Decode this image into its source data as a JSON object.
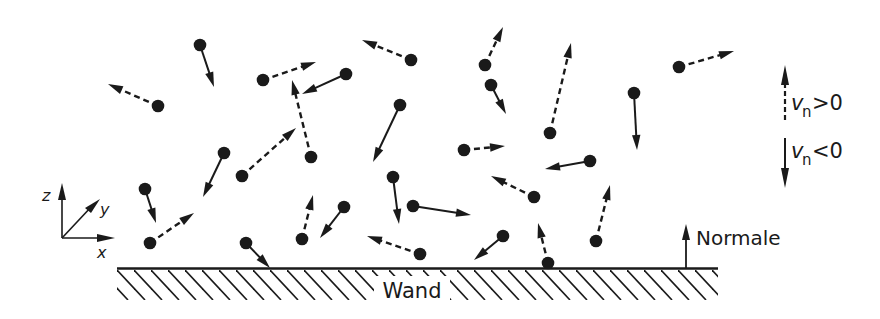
{
  "labels": {
    "wall": "Wand",
    "normal": "Normale",
    "axis_x": "x",
    "axis_y": "y",
    "axis_z": "z"
  },
  "legend": {
    "positive": {
      "symbol": "v",
      "subscript": "n",
      "relation": ">0",
      "line_style": "dashed",
      "direction": "up"
    },
    "negative": {
      "symbol": "v",
      "subscript": "n",
      "relation": "<0",
      "line_style": "solid",
      "direction": "down"
    }
  },
  "colors": {
    "ink": "#1a1a1a",
    "background": "#ffffff"
  },
  "particles": [
    {
      "id": 1,
      "vn": "negative"
    },
    {
      "id": 2,
      "vn": "positive"
    },
    {
      "id": 3,
      "vn": "positive"
    },
    {
      "id": 4,
      "vn": "negative"
    },
    {
      "id": 5,
      "vn": "positive"
    },
    {
      "id": 6,
      "vn": "positive"
    },
    {
      "id": 7,
      "vn": "negative"
    },
    {
      "id": 8,
      "vn": "negative"
    },
    {
      "id": 9,
      "vn": "positive"
    },
    {
      "id": 10,
      "vn": "positive"
    },
    {
      "id": 11,
      "vn": "negative"
    },
    {
      "id": 12,
      "vn": "positive"
    },
    {
      "id": 13,
      "vn": "negative"
    },
    {
      "id": 14,
      "vn": "positive"
    },
    {
      "id": 15,
      "vn": "positive"
    },
    {
      "id": 16,
      "vn": "negative"
    },
    {
      "id": 17,
      "vn": "positive"
    },
    {
      "id": 18,
      "vn": "negative"
    },
    {
      "id": 19,
      "vn": "positive"
    },
    {
      "id": 20,
      "vn": "negative"
    },
    {
      "id": 21,
      "vn": "negative"
    },
    {
      "id": 22,
      "vn": "positive"
    },
    {
      "id": 23,
      "vn": "negative"
    },
    {
      "id": 24,
      "vn": "positive"
    },
    {
      "id": 25,
      "vn": "negative"
    },
    {
      "id": 26,
      "vn": "positive"
    },
    {
      "id": 27,
      "vn": "positive"
    },
    {
      "id": 28,
      "vn": "positive"
    },
    {
      "id": 29,
      "vn": "negative"
    }
  ]
}
